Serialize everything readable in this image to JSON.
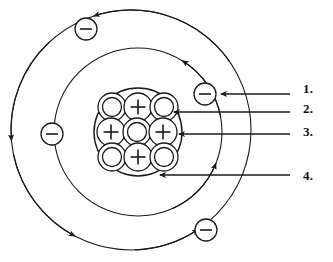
{
  "diagram": {
    "kind": "atom-structure",
    "stroke_color": "#1a1a1a",
    "fill_color": "#ffffff",
    "label_color": "#111111",
    "canvas": {
      "width": 333,
      "height": 262
    },
    "center": {
      "x": 138,
      "y": 132
    }
  },
  "nucleus": {
    "name": "nucleus",
    "circle": {
      "cx": 138,
      "cy": 132,
      "r": 44
    },
    "proton_symbol": "+",
    "neutron_symbol": "",
    "proton_count": 4,
    "neutron_count": 5,
    "particles": [
      {
        "type": "neutron",
        "symbol": "",
        "cx": 112,
        "cy": 107,
        "r": 14
      },
      {
        "type": "proton",
        "symbol": "+",
        "cx": 138,
        "cy": 107,
        "r": 14
      },
      {
        "type": "neutron",
        "symbol": "",
        "cx": 164,
        "cy": 107,
        "r": 14
      },
      {
        "type": "proton",
        "symbol": "+",
        "cx": 111,
        "cy": 132,
        "r": 14
      },
      {
        "type": "neutron",
        "symbol": "",
        "cx": 137,
        "cy": 132,
        "r": 14
      },
      {
        "type": "proton",
        "symbol": "+",
        "cx": 163,
        "cy": 132,
        "r": 14
      },
      {
        "type": "neutron",
        "symbol": "",
        "cx": 112,
        "cy": 157,
        "r": 14
      },
      {
        "type": "proton",
        "symbol": "+",
        "cx": 138,
        "cy": 157,
        "r": 14
      },
      {
        "type": "neutron",
        "symbol": "",
        "cx": 164,
        "cy": 157,
        "r": 14
      }
    ]
  },
  "orbits": [
    {
      "name": "inner-orbit",
      "cx": 138,
      "cy": 132,
      "r": 84,
      "electrons": 1
    },
    {
      "name": "outer-orbit",
      "cx": 131,
      "cy": 130,
      "r": 120,
      "electrons": 3
    }
  ],
  "electrons": [
    {
      "name": "electron-outer-top-left",
      "symbol": "",
      "cx": 86,
      "cy": 29,
      "r": 11,
      "orbit": "outer-orbit"
    },
    {
      "name": "electron-inner-right",
      "symbol": "",
      "cx": 205,
      "cy": 94,
      "r": 11,
      "orbit": "inner-orbit"
    },
    {
      "name": "electron-outer-left",
      "symbol": "",
      "cx": 52,
      "cy": 134,
      "r": 11,
      "orbit": "outer-orbit"
    },
    {
      "name": "electron-outer-bottom",
      "symbol": "",
      "cx": 206,
      "cy": 230,
      "r": 11,
      "orbit": "outer-orbit"
    }
  ],
  "callouts": [
    {
      "number": "1.",
      "name": "callout-1",
      "target": "electron-inner-right",
      "label_x": 303,
      "label_y": 81,
      "line_y": 94,
      "line_x_start": 290,
      "line_x_end": 221
    },
    {
      "number": "2.",
      "name": "callout-2",
      "target": "neutron-top-right",
      "label_x": 303,
      "label_y": 101,
      "line_y": 112,
      "line_x_start": 290,
      "line_x_end": 174
    },
    {
      "number": "3.",
      "name": "callout-3",
      "target": "proton-middle-right",
      "label_x": 303,
      "label_y": 124,
      "line_y": 134,
      "line_x_start": 290,
      "line_x_end": 179
    },
    {
      "number": "4.",
      "name": "callout-4",
      "target": "nucleus-boundary",
      "label_x": 303,
      "label_y": 168,
      "line_y": 175,
      "line_x_start": 290,
      "line_x_end": 160
    }
  ]
}
